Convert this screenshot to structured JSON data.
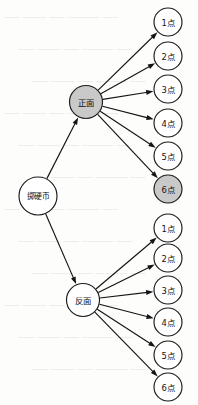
{
  "diagram": {
    "type": "probability-tree",
    "colors": {
      "highlight_fill": "#c9c9c9",
      "plain_fill": "#ffffff",
      "stroke": "#141414",
      "background": "#fdfdfc"
    },
    "root": {
      "id": "root",
      "label": "掷硬币",
      "cx": 38,
      "cy": 196,
      "r": 19,
      "highlighted": false
    },
    "branches": [
      {
        "id": "heads",
        "label": "正面",
        "cx": 86,
        "cy": 102,
        "r": 16.5,
        "highlighted": true
      },
      {
        "id": "tails",
        "label": "反面",
        "cx": 83,
        "cy": 300,
        "r": 16.5,
        "highlighted": false
      }
    ],
    "leaves": [
      {
        "id": "heads-1",
        "parent": "heads",
        "label": "1点",
        "cx": 168,
        "cy": 22,
        "r": 14,
        "highlighted": false
      },
      {
        "id": "heads-2",
        "parent": "heads",
        "label": "2点",
        "cx": 168,
        "cy": 56,
        "r": 14,
        "highlighted": false
      },
      {
        "id": "heads-3",
        "parent": "heads",
        "label": "3点",
        "cx": 168,
        "cy": 89,
        "r": 14,
        "highlighted": false
      },
      {
        "id": "heads-4",
        "parent": "heads",
        "label": "4点",
        "cx": 168,
        "cy": 123,
        "r": 14,
        "highlighted": false
      },
      {
        "id": "heads-5",
        "parent": "heads",
        "label": "5点",
        "cx": 168,
        "cy": 156,
        "r": 14,
        "highlighted": false
      },
      {
        "id": "heads-6",
        "parent": "heads",
        "label": "6点",
        "cx": 168,
        "cy": 189,
        "r": 14,
        "highlighted": true
      },
      {
        "id": "tails-1",
        "parent": "tails",
        "label": "1点",
        "cx": 168,
        "cy": 228,
        "r": 14,
        "highlighted": false
      },
      {
        "id": "tails-2",
        "parent": "tails",
        "label": "2点",
        "cx": 168,
        "cy": 258,
        "r": 14,
        "highlighted": false
      },
      {
        "id": "tails-3",
        "parent": "tails",
        "label": "3点",
        "cx": 168,
        "cy": 290,
        "r": 14,
        "highlighted": false
      },
      {
        "id": "tails-4",
        "parent": "tails",
        "label": "4点",
        "cx": 168,
        "cy": 322,
        "r": 14,
        "highlighted": false
      },
      {
        "id": "tails-5",
        "parent": "tails",
        "label": "5点",
        "cx": 168,
        "cy": 355,
        "r": 14,
        "highlighted": false
      },
      {
        "id": "tails-6",
        "parent": "tails",
        "label": "6点",
        "cx": 168,
        "cy": 387,
        "r": 14,
        "highlighted": false
      }
    ],
    "edges": [
      {
        "id": "edge-root-heads",
        "from": "root",
        "to": "heads"
      },
      {
        "id": "edge-root-tails",
        "from": "root",
        "to": "tails"
      },
      {
        "id": "edge-heads-1",
        "from": "heads",
        "to": "heads-1"
      },
      {
        "id": "edge-heads-2",
        "from": "heads",
        "to": "heads-2"
      },
      {
        "id": "edge-heads-3",
        "from": "heads",
        "to": "heads-3"
      },
      {
        "id": "edge-heads-4",
        "from": "heads",
        "to": "heads-4"
      },
      {
        "id": "edge-heads-5",
        "from": "heads",
        "to": "heads-5"
      },
      {
        "id": "edge-heads-6",
        "from": "heads",
        "to": "heads-6"
      },
      {
        "id": "edge-tails-1",
        "from": "tails",
        "to": "tails-1"
      },
      {
        "id": "edge-tails-2",
        "from": "tails",
        "to": "tails-2"
      },
      {
        "id": "edge-tails-3",
        "from": "tails",
        "to": "tails-3"
      },
      {
        "id": "edge-tails-4",
        "from": "tails",
        "to": "tails-4"
      },
      {
        "id": "edge-tails-5",
        "from": "tails",
        "to": "tails-5"
      },
      {
        "id": "edge-tails-6",
        "from": "tails",
        "to": "tails-6"
      }
    ]
  }
}
